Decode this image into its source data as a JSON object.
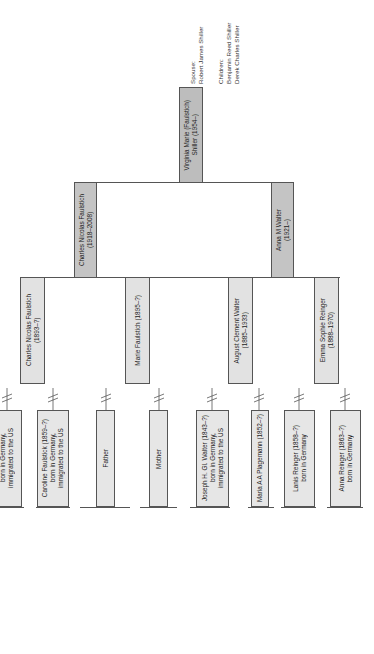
{
  "subject": {
    "name_line1": "Virginia Marie (Faulstich)",
    "name_line2": "Shiller (1954–)",
    "annotation": {
      "spouse_label": "Spouse:",
      "spouse": "Robert James Shiller",
      "children_label": "Children:",
      "children": [
        "Benjamin Reed Shiller",
        "Derek Charles Shiller"
      ]
    }
  },
  "parents": [
    {
      "name": "Charles Nicolas Faulstich",
      "dates": "(1918–2008)"
    },
    {
      "name": "Anna M Walter",
      "dates": "(1921–)"
    }
  ],
  "grandparents": [
    {
      "name": "Charles Nicolas Faulstich",
      "dates": "(1893–?)"
    },
    {
      "name": "Marie Faulstich (1895–?)",
      "dates": ""
    },
    {
      "name": "August Clement Walter",
      "dates": "(1885–1933)"
    },
    {
      "name": "Emma Sophie Reinger",
      "dates": "(1888–1970)"
    }
  ],
  "great_grandparents": [
    {
      "text": "born in Germany,\nimmigrated to the US"
    },
    {
      "text": "Caroline Faulstick (1859–?)\nborn in Germany,\nimmigrated to the US"
    },
    {
      "text": "Father"
    },
    {
      "text": "Mother"
    },
    {
      "text": "Joseph H. Gl. Walter (1843–?)\nborn in Germany,\nimmigrated to the US"
    },
    {
      "text": "Maria A A Plagemann (1852–?)"
    },
    {
      "text": "Lanis Reinger (1858–?)\nborn in Germany"
    },
    {
      "text": "Anna Reinger (1863–?)\nborn in Germany"
    }
  ],
  "colors": {
    "subject_box": "#bdbdbd",
    "parent_box": "#c4c4c4",
    "ancestor_box": "#e2e2e2",
    "line": "#555555"
  }
}
